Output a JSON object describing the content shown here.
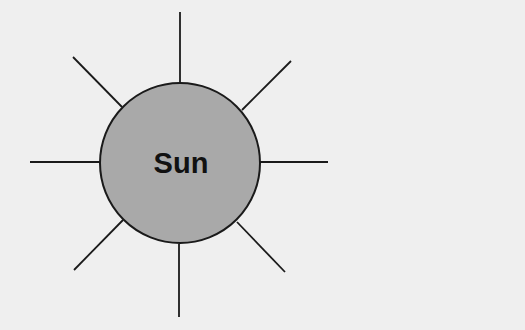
{
  "diagram": {
    "title": "Sun",
    "colors": {
      "background": "#efefef",
      "sun_fill": "#a9a9a9",
      "stroke": "#1a1a1a",
      "label": "#111111"
    },
    "sun": {
      "label": "Sun",
      "center": [
        180,
        163
      ],
      "radius": 80
    },
    "rays": [
      {
        "name": "top",
        "x1": 180,
        "y1": 12,
        "x2": 180,
        "y2": 83
      },
      {
        "name": "top-right",
        "x1": 242,
        "y1": 110,
        "x2": 291,
        "y2": 61
      },
      {
        "name": "right",
        "x1": 260,
        "y1": 162,
        "x2": 328,
        "y2": 162
      },
      {
        "name": "bottom-right",
        "x1": 237,
        "y1": 222,
        "x2": 285,
        "y2": 272
      },
      {
        "name": "bottom",
        "x1": 179,
        "y1": 244,
        "x2": 179,
        "y2": 317
      },
      {
        "name": "bottom-left",
        "x1": 123,
        "y1": 220,
        "x2": 74,
        "y2": 270
      },
      {
        "name": "left",
        "x1": 30,
        "y1": 162,
        "x2": 100,
        "y2": 162
      },
      {
        "name": "top-left",
        "x1": 73,
        "y1": 57,
        "x2": 122,
        "y2": 107
      }
    ]
  }
}
